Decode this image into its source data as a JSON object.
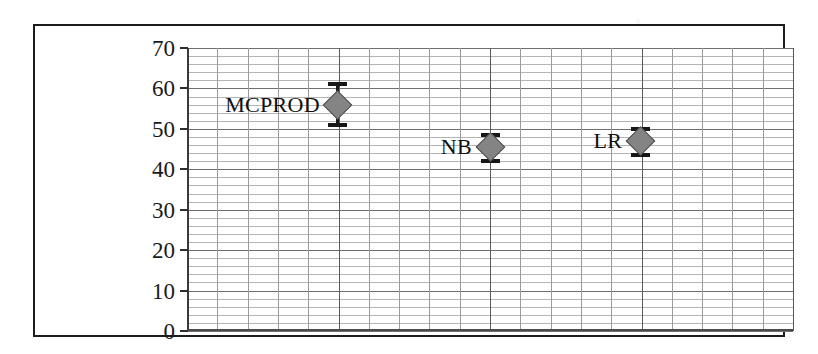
{
  "figure": {
    "frame_color": "#1c1c1c",
    "background": "#ffffff"
  },
  "chart_data": {
    "type": "scatter",
    "title": "",
    "subtitle": "",
    "xlabel": "",
    "ylabel": "Accuracy",
    "ylim": [
      0,
      70
    ],
    "y_ticks": [
      0,
      10,
      20,
      30,
      40,
      50,
      60,
      70
    ],
    "y_tick_labels": [
      "0",
      "10",
      "20",
      "30",
      "40",
      "50",
      "60",
      "70"
    ],
    "y_major_step": 10,
    "y_minor_step": 2,
    "grid": true,
    "grid_style": "dense horizontal minor lines with vertical major lines",
    "legend": false,
    "legend_position": "none",
    "marker_shape": "diamond",
    "marker_color": "#848484",
    "errorbar_color": "#171717",
    "categories": [
      "MCPROD",
      "NB",
      "LR"
    ],
    "values": [
      56,
      45.5,
      47
    ],
    "error_low": [
      51,
      42,
      43.5
    ],
    "error_high": [
      61,
      48.5,
      50
    ],
    "points": [
      {
        "label": "MCPROD",
        "value": 56,
        "error_low": 51,
        "error_high": 48.5,
        "ci_low": 51,
        "ci_high": 61,
        "x_frac": 0.249,
        "label_offset_px": -18
      },
      {
        "label": "NB",
        "value": 45.5,
        "ci_low": 42,
        "ci_high": 48.5,
        "x_frac": 0.5,
        "label_offset_px": -18
      },
      {
        "label": "LR",
        "value": 47,
        "ci_low": 43.5,
        "ci_high": 50,
        "x_frac": 0.748,
        "label_offset_px": -18
      }
    ]
  }
}
